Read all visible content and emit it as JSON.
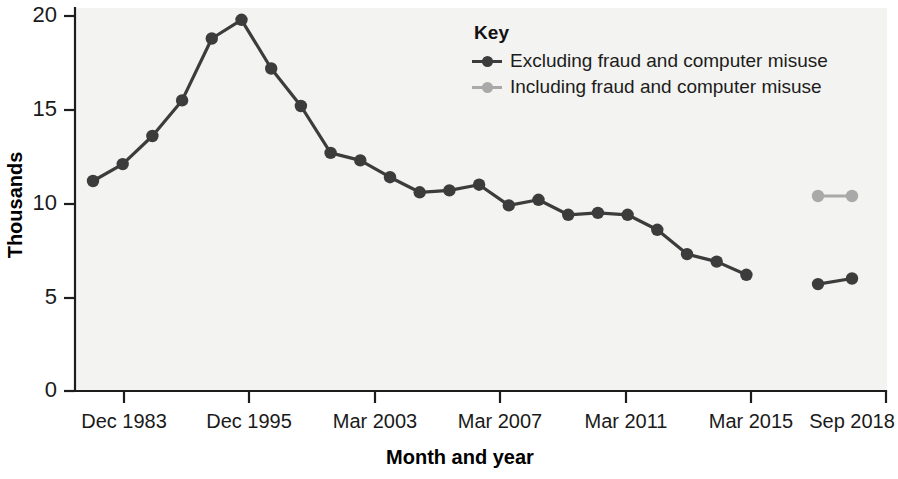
{
  "chart_data": {
    "type": "line",
    "title": "",
    "xlabel": "Month and year",
    "ylabel": "Thousands",
    "ylim": [
      0,
      20
    ],
    "yticks": [
      0,
      5,
      10,
      15,
      20
    ],
    "ytick_labels": [
      "0",
      "5",
      "10",
      "15",
      "20"
    ],
    "xtick_labels": [
      "Dec 1983",
      "Dec 1995",
      "Mar 2003",
      "Mar 2007",
      "Mar 2011",
      "Mar 2015",
      "Sep 2018"
    ],
    "grid": false,
    "legend_position": "top-right",
    "legend_title": "Key",
    "series": [
      {
        "name": "Excluding fraud and computer misuse",
        "color": "#3c3c3c",
        "values": [
          11.2,
          12.1,
          13.6,
          15.5,
          18.8,
          19.8,
          17.2,
          15.2,
          12.7,
          12.3,
          11.4,
          10.6,
          10.7,
          11.0,
          9.9,
          10.2,
          9.4,
          9.5,
          9.4,
          8.6,
          7.3,
          6.9,
          6.2
        ],
        "detached_values": [
          5.7,
          6.0
        ]
      },
      {
        "name": "Including fraud and computer misuse",
        "color": "#a9a9a9",
        "values": [
          10.4,
          10.4
        ]
      }
    ]
  },
  "legend": {
    "title": "Key",
    "items": [
      {
        "label": "Excluding fraud and computer misuse",
        "color": "#3c3c3c"
      },
      {
        "label": "Including fraud and computer misuse",
        "color": "#a9a9a9"
      }
    ]
  },
  "axes": {
    "y_title": "Thousands",
    "x_title": "Month and year",
    "y_ticks": [
      "20",
      "15",
      "10",
      "5",
      "0"
    ],
    "x_ticks": [
      "Dec 1983",
      "Dec 1995",
      "Mar 2003",
      "Mar 2007",
      "Mar 2011",
      "Mar 2015",
      "Sep 2018"
    ]
  }
}
